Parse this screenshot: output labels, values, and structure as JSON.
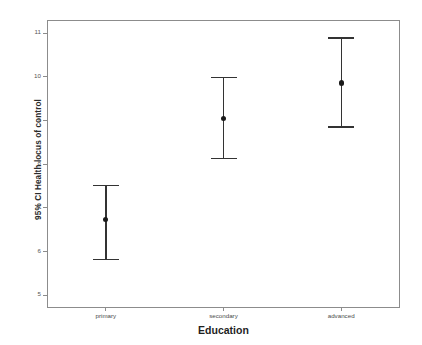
{
  "chart_data": {
    "type": "scatter",
    "title": "",
    "subtitle": "",
    "xlabel": "Education",
    "ylabel": "95% CI Health locus of control",
    "categories": [
      "primary",
      "secondary",
      "advanced"
    ],
    "x_tick_labels": [
      "primary",
      "secondary",
      "advanced"
    ],
    "y_tick_labels": [
      "11",
      "10",
      "9",
      "8",
      "7",
      "6",
      "5"
    ],
    "y_tick_values": [
      11,
      10,
      9,
      8,
      7,
      6,
      5
    ],
    "ylim": [
      4.71,
      11.3
    ],
    "grid": false,
    "legend": null,
    "series": [
      {
        "name": "95% CI Health locus of control",
        "marker": "filled-circle",
        "error_style": "capped-error-bar",
        "points": [
          {
            "category": "primary",
            "mean": 6.74,
            "ci_lower": 5.84,
            "ci_upper": 7.53
          },
          {
            "category": "secondary",
            "mean": 9.05,
            "ci_lower": 8.15,
            "ci_upper": 10.0
          },
          {
            "category": "advanced",
            "mean": 9.86,
            "ci_lower": 8.87,
            "ci_upper": 10.9
          }
        ]
      }
    ],
    "colors": {
      "marker": "#1a1a1a",
      "error_bar": "#333333",
      "frame": "#8c8c8c",
      "background": "#ffffff",
      "tick_label": "#555555",
      "axis_title": "#1f1f1f"
    }
  }
}
